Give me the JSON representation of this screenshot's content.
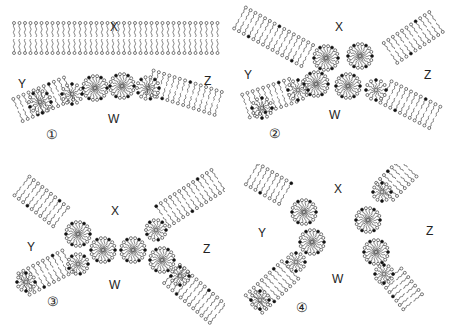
{
  "figure": {
    "type": "membrane fusion stages diagram",
    "panels": [
      {
        "id": "1",
        "number_label": "①",
        "region_labels": {
          "X": "X",
          "Y": "Y",
          "Z": "Z",
          "W": "W"
        },
        "stage": "bilayers apposed, micellar intermediates in lower bilayer"
      },
      {
        "id": "2",
        "number_label": "②",
        "region_labels": {
          "X": "X",
          "Y": "Y",
          "Z": "Z",
          "W": "W"
        },
        "stage": "both bilayers bent, micellar contact"
      },
      {
        "id": "3",
        "number_label": "③",
        "region_labels": {
          "X": "X",
          "Y": "Y",
          "Z": "Z",
          "W": "W"
        },
        "stage": "X-shaped junction of bilayers"
      },
      {
        "id": "4",
        "number_label": "④",
        "region_labels": {
          "X": "X",
          "Y": "Y",
          "Z": "Z",
          "W": "W"
        },
        "stage": "bilayers separated into two bent segments"
      }
    ]
  }
}
